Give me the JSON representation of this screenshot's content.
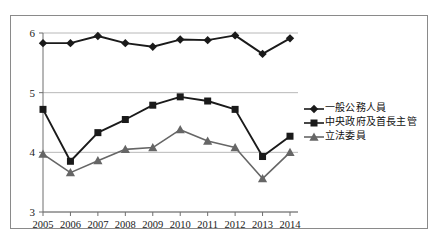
{
  "chart_data": {
    "type": "line",
    "title": "",
    "xlabel": "",
    "ylabel": "",
    "ylim": [
      3,
      6
    ],
    "yticks": [
      3,
      4,
      5,
      6
    ],
    "grid": true,
    "legend_position": "right",
    "categories": [
      "2005",
      "2006",
      "2007",
      "2008",
      "2009",
      "2010",
      "2011",
      "2012",
      "2013",
      "2014"
    ],
    "series": [
      {
        "name": "一般公務人員",
        "marker": "diamond",
        "color": "#1a1a1a",
        "values": [
          5.83,
          5.83,
          5.95,
          5.83,
          5.77,
          5.89,
          5.88,
          5.96,
          5.65,
          5.91
        ]
      },
      {
        "name": "中央政府及首長主管",
        "marker": "square",
        "color": "#1a1a1a",
        "values": [
          4.72,
          3.85,
          4.33,
          4.55,
          4.79,
          4.93,
          4.86,
          4.72,
          3.93,
          4.27
        ]
      },
      {
        "name": "立法委員",
        "marker": "triangle",
        "color": "#666666",
        "values": [
          3.97,
          3.66,
          3.86,
          4.05,
          4.08,
          4.38,
          4.19,
          4.08,
          3.56,
          4.0
        ]
      }
    ]
  },
  "axis": {
    "ytick_labels": [
      "6",
      "5",
      "4",
      "3"
    ],
    "xtick_labels": [
      "2005",
      "2006",
      "2007",
      "2008",
      "2009",
      "2010",
      "2011",
      "2012",
      "2013",
      "2014"
    ]
  },
  "legend": {
    "items": [
      {
        "label": "一般公務人員",
        "marker": "diamond",
        "color": "#1a1a1a"
      },
      {
        "label": "中央政府及首長主管",
        "marker": "square",
        "color": "#1a1a1a"
      },
      {
        "label": "立法委員",
        "marker": "triangle",
        "color": "#666666"
      }
    ]
  }
}
